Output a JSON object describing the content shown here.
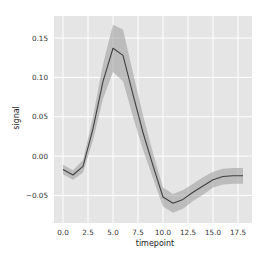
{
  "chart_data": {
    "type": "line",
    "title": "",
    "xlabel": "timepoint",
    "ylabel": "signal",
    "xlim": [
      -0.9,
      18.9
    ],
    "ylim": [
      -0.085,
      0.178
    ],
    "x_ticks": [
      0.0,
      2.5,
      5.0,
      7.5,
      10.0,
      12.5,
      15.0,
      17.5
    ],
    "x_tick_labels": [
      "0.0",
      "2.5",
      "5.0",
      "7.5",
      "10.0",
      "12.5",
      "15.0",
      "17.5"
    ],
    "y_ticks": [
      -0.05,
      0.0,
      0.05,
      0.1,
      0.15
    ],
    "y_tick_labels": [
      "−0.05",
      "0.00",
      "0.05",
      "0.10",
      "0.15"
    ],
    "grid": true,
    "legend": null,
    "x": [
      0,
      1,
      2,
      3,
      4,
      5,
      6,
      7,
      8,
      9,
      10,
      11,
      12,
      13,
      14,
      15,
      16,
      17,
      18
    ],
    "series": [
      {
        "name": "signal (mean)",
        "values": [
          -0.017,
          -0.024,
          -0.013,
          0.035,
          0.095,
          0.137,
          0.128,
          0.078,
          0.03,
          -0.012,
          -0.052,
          -0.06,
          -0.055,
          -0.046,
          -0.038,
          -0.03,
          -0.026,
          -0.025,
          -0.025
        ],
        "ci_lower": [
          -0.023,
          -0.03,
          -0.021,
          0.02,
          0.073,
          0.107,
          0.095,
          0.05,
          0.008,
          -0.028,
          -0.064,
          -0.072,
          -0.067,
          -0.057,
          -0.049,
          -0.04,
          -0.036,
          -0.035,
          -0.035
        ],
        "ci_upper": [
          -0.011,
          -0.018,
          -0.005,
          0.05,
          0.117,
          0.167,
          0.161,
          0.106,
          0.052,
          0.004,
          -0.04,
          -0.048,
          -0.043,
          -0.035,
          -0.027,
          -0.02,
          -0.016,
          -0.015,
          -0.015
        ]
      }
    ]
  },
  "style": {
    "plot_background": "#e5e5e5",
    "grid_color": "#ffffff",
    "line_color": "#3f3f3f",
    "band_color": "#9a9a9a",
    "band_opacity": 0.55
  }
}
